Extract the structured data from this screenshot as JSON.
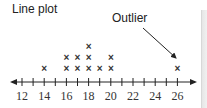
{
  "chart_data": {
    "type": "dot",
    "title": "Line plot",
    "annotation": "Outlier",
    "annotation_target": 26,
    "xlabel": "",
    "ylabel": "",
    "xlim": [
      12,
      26
    ],
    "tick_step": 1,
    "tick_labels": [
      "12",
      "14",
      "16",
      "18",
      "20",
      "22",
      "24",
      "26"
    ],
    "points": [
      {
        "x": 14,
        "count": 1
      },
      {
        "x": 16,
        "count": 2
      },
      {
        "x": 17,
        "count": 2
      },
      {
        "x": 18,
        "count": 3
      },
      {
        "x": 19,
        "count": 1
      },
      {
        "x": 20,
        "count": 2
      },
      {
        "x": 26,
        "count": 1
      }
    ],
    "marker": "x"
  }
}
